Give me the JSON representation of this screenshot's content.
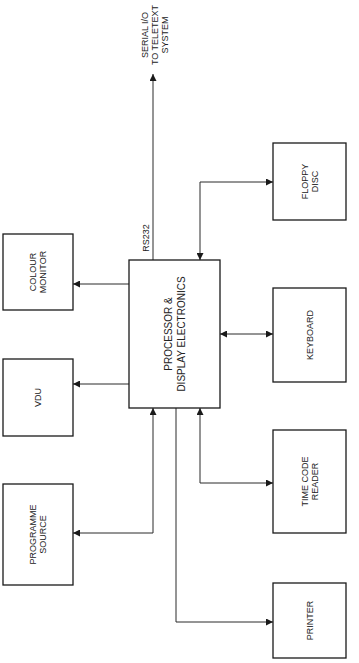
{
  "diagram": {
    "central": {
      "id": "processor",
      "lines": [
        "PROCESSOR &",
        "DISPLAY ELECTRONICS"
      ]
    },
    "blocks": [
      {
        "id": "colour-monitor",
        "lines": [
          "COLOUR",
          "MONITOR"
        ]
      },
      {
        "id": "vdu",
        "lines": [
          "VDU"
        ]
      },
      {
        "id": "programme-source",
        "lines": [
          "PROGRAMME",
          "SOURCE"
        ]
      },
      {
        "id": "floppy-disc",
        "lines": [
          "FLOPPY",
          "DISC"
        ]
      },
      {
        "id": "keyboard",
        "lines": [
          "KEYBOARD"
        ]
      },
      {
        "id": "time-code-reader",
        "lines": [
          "TIME CODE",
          "READER"
        ]
      },
      {
        "id": "printer",
        "lines": [
          "PRINTER"
        ]
      }
    ],
    "external_output": {
      "lines": [
        "SERIAL I/O",
        "TO TELETEXT",
        "SYSTEM"
      ]
    },
    "link_label": "RS232",
    "connections": [
      {
        "from": "processor",
        "to": "serial-output",
        "direction": "out",
        "label": "RS232"
      },
      {
        "from": "processor",
        "to": "floppy-disc",
        "direction": "bidirectional"
      },
      {
        "from": "processor",
        "to": "colour-monitor",
        "direction": "out"
      },
      {
        "from": "processor",
        "to": "vdu",
        "direction": "out"
      },
      {
        "from": "processor",
        "to": "keyboard",
        "direction": "bidirectional"
      },
      {
        "from": "processor",
        "to": "programme-source",
        "direction": "bidirectional"
      },
      {
        "from": "processor",
        "to": "time-code-reader",
        "direction": "bidirectional"
      },
      {
        "from": "processor",
        "to": "printer",
        "direction": "out"
      }
    ]
  }
}
